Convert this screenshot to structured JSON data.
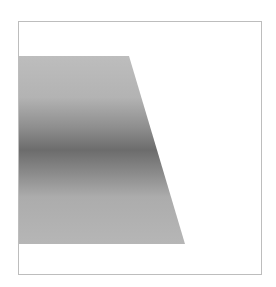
{
  "figure": {
    "frame_border_color": "#bdbdbd",
    "shape": {
      "type": "trapezoid",
      "gradient_stops": [
        "#bdbdbd",
        "#b3b3b3",
        "#8e8e8e",
        "#6c6c6c",
        "#8a8a8a",
        "#acacac",
        "#b6b6b6"
      ]
    },
    "caption": ""
  }
}
